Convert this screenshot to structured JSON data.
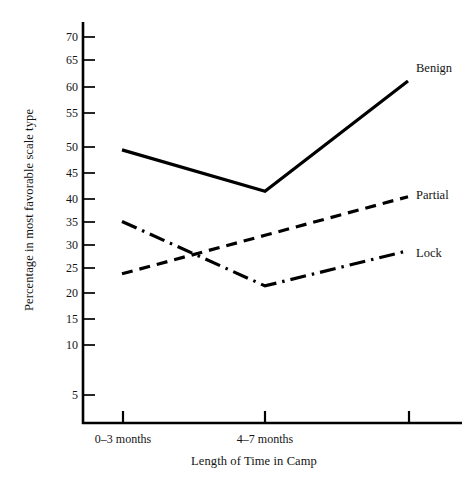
{
  "chart_data": {
    "type": "line",
    "title": "",
    "xlabel": "Length of Time in Camp",
    "ylabel": "Percentage in most favorable scale type",
    "categories": [
      "0–3 months",
      "4–7 months",
      ""
    ],
    "x_tick_labels": [
      "0–3 months",
      "4–7 months",
      ""
    ],
    "y_tick_labels": [
      "5",
      "10",
      "15",
      "20",
      "25",
      "30",
      "35",
      "40",
      "45",
      "50",
      "55",
      "60",
      "65",
      "70"
    ],
    "y_ticks": [
      5,
      10,
      15,
      20,
      25,
      30,
      35,
      40,
      45,
      50,
      55,
      60,
      65,
      70
    ],
    "ylim": [
      0,
      73
    ],
    "grid": false,
    "legend_position": "right-of-line-ends",
    "series": [
      {
        "name": "Benign",
        "label": "Benign",
        "style": "solid",
        "color": "#000000",
        "values": [
          49.5,
          42.0,
          62.0
        ]
      },
      {
        "name": "Partial",
        "label": "Partial",
        "style": "dashed",
        "color": "#000000",
        "values": [
          27.0,
          34.0,
          41.0
        ]
      },
      {
        "name": "Lock",
        "label": "Lock",
        "style": "dash-dot",
        "color": "#000000",
        "values": [
          36.5,
          24.8,
          31.2
        ]
      }
    ]
  },
  "labels": {
    "y_axis_title": "Percentage in most favorable scale type",
    "x_axis_title": "Length of Time in Camp",
    "series_benign": "Benign",
    "series_partial": "Partial",
    "series_lock": "Lock",
    "x_tick_1": "0–3 months",
    "x_tick_2": "4–7 months",
    "y_tick_70": "70",
    "y_tick_65": "65",
    "y_tick_60": "60",
    "y_tick_55": "55",
    "y_tick_50": "50",
    "y_tick_45": "45",
    "y_tick_40": "40",
    "y_tick_35": "35",
    "y_tick_30": "30",
    "y_tick_25": "25",
    "y_tick_20": "20",
    "y_tick_15": "15",
    "y_tick_10": "10",
    "y_tick_5": "5"
  },
  "colors": {
    "ink": "#000000",
    "background": "#ffffff"
  }
}
